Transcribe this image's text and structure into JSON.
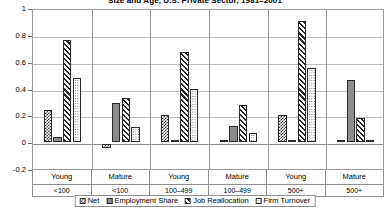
{
  "chart_data": {
    "type": "bar",
    "title": "Size and Age, U.S. Private Sector, 1981–2001",
    "xlabel": "",
    "ylabel": "",
    "ylim": [
      -0.2,
      1.0
    ],
    "ytick_labels": [
      "1",
      "0.8",
      "0.6",
      "0.4",
      "0.2",
      "0",
      "-0.2"
    ],
    "ytick_values": [
      1,
      0.8,
      0.6,
      0.4,
      0.2,
      0,
      -0.2
    ],
    "grid": true,
    "legend_position": "bottom",
    "categories": [
      "Young",
      "Mature",
      "Young",
      "Mature",
      "Young",
      "Mature"
    ],
    "group_sizes": [
      "<100",
      "<100",
      "100–499",
      "100–499",
      "500+",
      "500+"
    ],
    "series": [
      {
        "name": "Net",
        "pattern": "checkerboard",
        "values": [
          0.24,
          -0.03,
          0.2,
          0.005,
          0.2,
          0.01
        ]
      },
      {
        "name": "Employment Share",
        "pattern": "solid-gray",
        "values": [
          0.04,
          0.29,
          0.01,
          0.12,
          0.005,
          0.46
        ]
      },
      {
        "name": "Job Reallocation",
        "pattern": "diagonal-hatch",
        "values": [
          0.76,
          0.33,
          0.67,
          0.28,
          0.9,
          0.18
        ]
      },
      {
        "name": "Firm Turnover",
        "pattern": "fine-dots",
        "values": [
          0.48,
          0.11,
          0.4,
          0.07,
          0.55,
          0.02
        ]
      }
    ]
  },
  "legend": {
    "items": [
      {
        "label": "Net"
      },
      {
        "label": "Employment Share"
      },
      {
        "label": "Job Reallocation"
      },
      {
        "label": "Firm Turnover"
      }
    ]
  }
}
